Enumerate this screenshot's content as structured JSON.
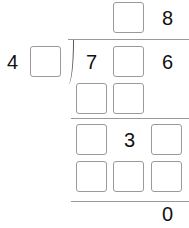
{
  "divisor": {
    "known_digit": "4"
  },
  "quotient": {
    "last_digit": "8"
  },
  "dividend": {
    "first_digit": "7",
    "last_digit": "6"
  },
  "step2": {
    "middle_digit": "3"
  },
  "remainder": "0"
}
